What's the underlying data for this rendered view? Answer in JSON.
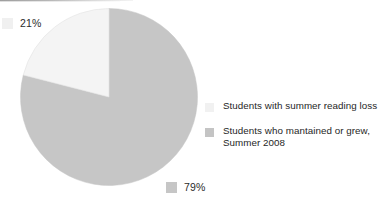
{
  "chart_data": {
    "type": "pie",
    "title": "",
    "subtitle": "",
    "xlabel": "",
    "ylabel": "",
    "grid": false,
    "legend_position": "right",
    "start_angle_deg": 0,
    "direction": "clockwise",
    "categories": [
      "Students with summer reading loss",
      "Students who mantained or grew, Summer 2008"
    ],
    "values": [
      21,
      79
    ],
    "value_labels": [
      "21%",
      "79%"
    ],
    "colors": [
      "#f4f4f4",
      "#c6c6c6"
    ],
    "slices": [
      {
        "name": "Students with summer reading loss",
        "value": 21,
        "label": "21%",
        "color": "#f4f4f4",
        "stroke": "#e2e2e2"
      },
      {
        "name": "Students who mantained or grew, Summer 2008",
        "value": 79,
        "label": "79%",
        "color": "#c6c6c6",
        "stroke": "#c6c6c6"
      }
    ]
  },
  "data_labels": [
    {
      "value": "21%",
      "swatch_color": "#f0f0f0"
    },
    {
      "value": "79%",
      "swatch_color": "#c6c6c6"
    }
  ],
  "legend": {
    "items": [
      {
        "label": "Students with summer reading loss",
        "swatch_color": "#f1f1f1"
      },
      {
        "label": "Students who mantained or grew, Summer 2008",
        "swatch_color": "#c4c4c4"
      }
    ]
  },
  "colors": {
    "background": "#ffffff",
    "slice_light": "#f4f4f4",
    "slice_gray": "#c6c6c6",
    "text": "#2a2a2a"
  }
}
